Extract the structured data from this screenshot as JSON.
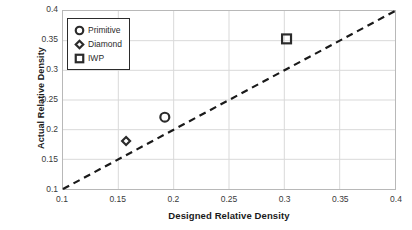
{
  "chart_data": {
    "type": "scatter",
    "title": "",
    "xlabel": "Designed Relative Density",
    "ylabel": "Actual Relative Density",
    "xlim": [
      0.1,
      0.4
    ],
    "ylim": [
      0.1,
      0.4
    ],
    "xticks": [
      "0.1",
      "0.15",
      "0.2",
      "0.25",
      "0.3",
      "0.35",
      "0.4"
    ],
    "yticks": [
      "0.1",
      "0.15",
      "0.2",
      "0.25",
      "0.3",
      "0.35",
      "0.4"
    ],
    "xtick_values": [
      0.1,
      0.15,
      0.2,
      0.25,
      0.3,
      0.35,
      0.4
    ],
    "ytick_values": [
      0.1,
      0.15,
      0.2,
      0.25,
      0.3,
      0.35,
      0.4
    ],
    "grid": true,
    "legend_position": "top-left-inside",
    "series": [
      {
        "name": "Primitive",
        "marker": "circle",
        "marker_fill": "none",
        "marker_edge": "#2b2b2b",
        "points": [
          {
            "x": 0.192,
            "y": 0.221
          }
        ]
      },
      {
        "name": "Diamond",
        "marker": "diamond",
        "marker_fill": "none",
        "marker_edge": "#2b2b2b",
        "points": [
          {
            "x": 0.157,
            "y": 0.181
          }
        ]
      },
      {
        "name": "IWP",
        "marker": "square",
        "marker_fill": "none",
        "marker_edge": "#2b2b2b",
        "points": [
          {
            "x": 0.302,
            "y": 0.353
          }
        ]
      }
    ],
    "reference_line": {
      "name": "parity-line",
      "style": "dashed",
      "color": "#1a1a1a",
      "from": {
        "x": 0.1,
        "y": 0.1
      },
      "to": {
        "x": 0.4,
        "y": 0.4
      }
    }
  },
  "legend": {
    "items": [
      {
        "label": "Primitive",
        "marker": "circle"
      },
      {
        "label": "Diamond",
        "marker": "diamond"
      },
      {
        "label": "IWP",
        "marker": "square"
      }
    ]
  },
  "colors": {
    "marker_edge": "#2b2b2b",
    "grid": "#d9d9d9",
    "frame": "#b8b8b8",
    "line": "#1a1a1a",
    "text": "#1a1a1a"
  }
}
